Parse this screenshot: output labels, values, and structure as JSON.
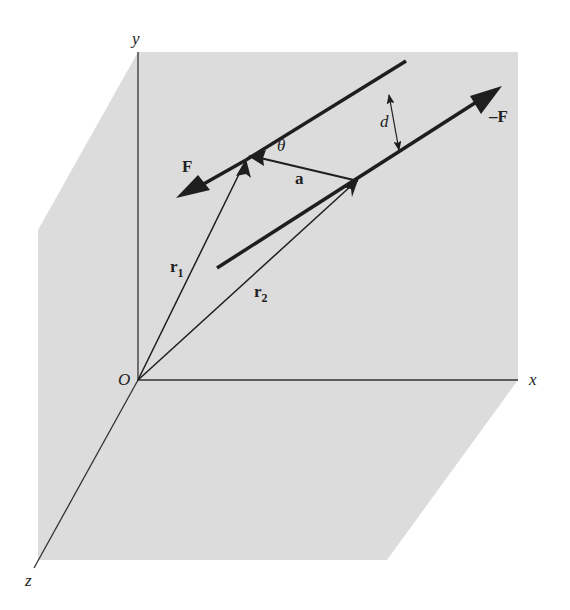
{
  "figure": {
    "type": "3d-vector-diagram",
    "colors": {
      "plane_fill": "#dcdcdc",
      "line": "#1e1e1e",
      "background": "#ffffff"
    },
    "axes": {
      "origin_label": "O",
      "x_label": "x",
      "y_label": "y",
      "z_label": "z"
    },
    "vectors": {
      "force_label": "F",
      "neg_force_label": "–F",
      "r1_label": "r",
      "r1_sub": "1",
      "r2_label": "r",
      "r2_sub": "2",
      "a_label": "a"
    },
    "annotations": {
      "angle_label": "θ",
      "distance_label": "d"
    }
  }
}
